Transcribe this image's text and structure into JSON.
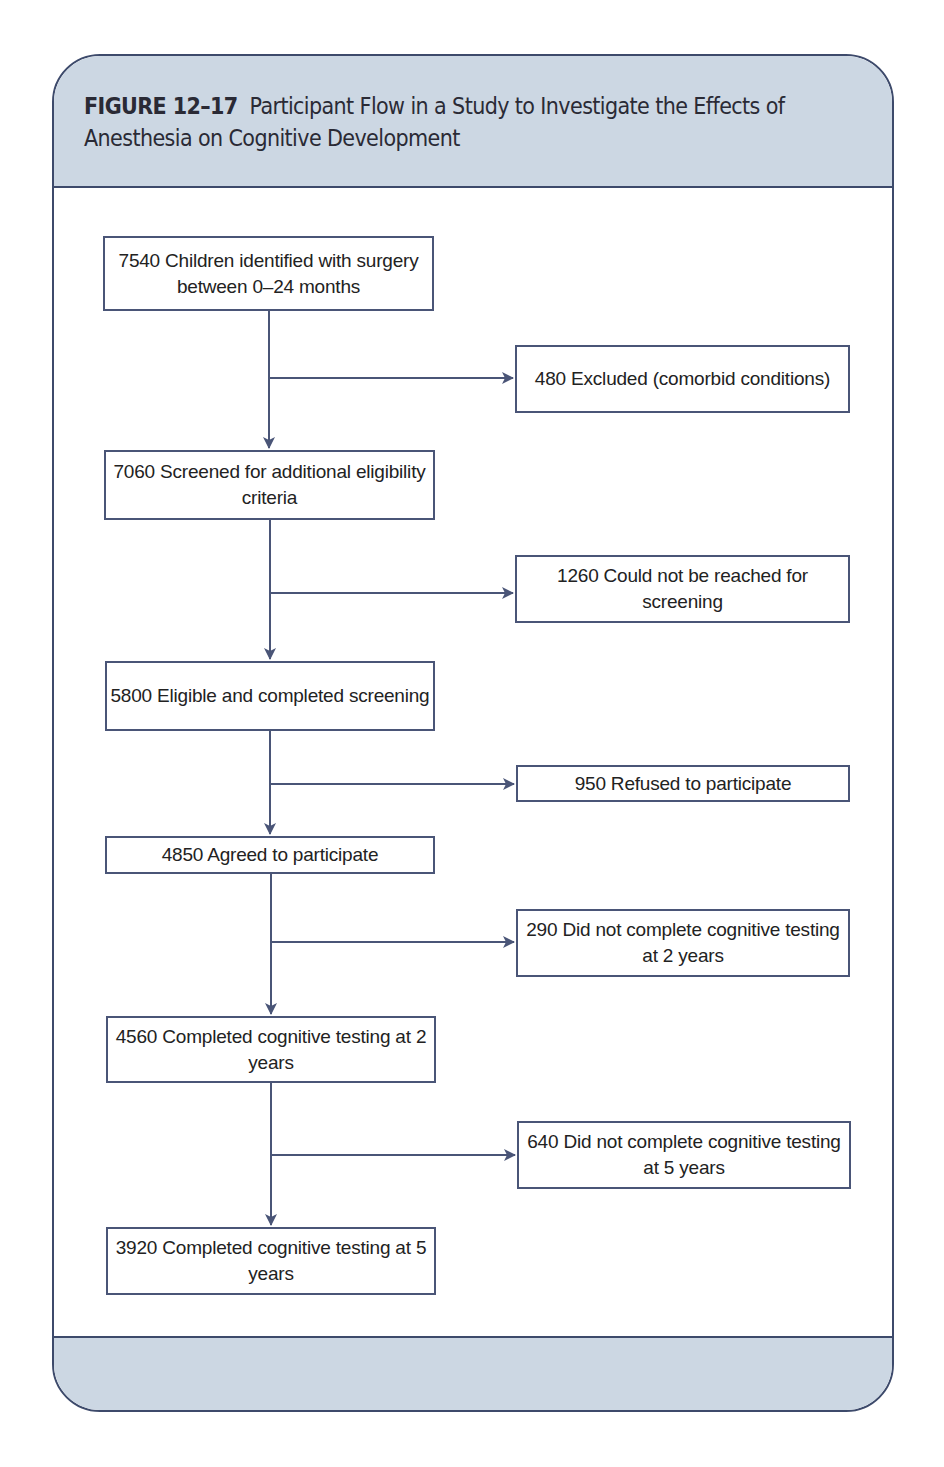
{
  "figure": {
    "label": "FIGURE 12–17",
    "title": "Participant Flow in a Study to Investigate the Effects of Anesthesia on Cognitive Development"
  },
  "colors": {
    "header_bg": "#ccd7e3",
    "border": "#3d4a6b",
    "arrow": "#4a5577"
  },
  "main_flow": [
    {
      "count": 7540,
      "text": "7540 Children identified with surgery between 0–24 months"
    },
    {
      "count": 7060,
      "text": "7060 Screened for additional eligibility criteria"
    },
    {
      "count": 5800,
      "text": "5800 Eligible and completed screening"
    },
    {
      "count": 4850,
      "text": "4850 Agreed to participate"
    },
    {
      "count": 4560,
      "text": "4560 Completed cognitive testing at 2 years"
    },
    {
      "count": 3920,
      "text": "3920 Completed cognitive testing at 5 years"
    }
  ],
  "exclusions": [
    {
      "count": 480,
      "text": "480 Excluded (comorbid conditions)"
    },
    {
      "count": 1260,
      "text": "1260 Could not be reached for screening"
    },
    {
      "count": 950,
      "text": "950 Refused to participate"
    },
    {
      "count": 290,
      "text": "290 Did not complete cognitive testing at 2 years"
    },
    {
      "count": 640,
      "text": "640 Did not complete cognitive testing at 5 years"
    }
  ]
}
